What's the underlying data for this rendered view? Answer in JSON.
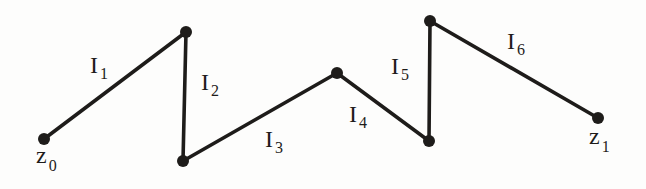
{
  "page": {
    "background": "#fdfdfc"
  },
  "diagram": {
    "ink_color": "#1e1c1a",
    "stroke_width": 3.6,
    "dot_radius": 6,
    "label_font_size": 24,
    "subscript_font_size": 16,
    "subscript_dy": 6,
    "endpoint_subscript_dy": 8,
    "vertices": [
      {
        "id": "z0",
        "x": 44,
        "y": 139
      },
      {
        "id": "v1",
        "x": 186,
        "y": 32
      },
      {
        "id": "v2",
        "x": 183,
        "y": 161
      },
      {
        "id": "v3",
        "x": 337,
        "y": 73
      },
      {
        "id": "v4",
        "x": 429,
        "y": 141
      },
      {
        "id": "v5",
        "x": 430,
        "y": 21
      },
      {
        "id": "z1",
        "x": 598,
        "y": 118
      }
    ],
    "segments": [
      {
        "id": "I1",
        "from": "z0",
        "to": "v1",
        "label": {
          "base": "I",
          "sub": "1",
          "x": 90,
          "y": 73
        }
      },
      {
        "id": "I2",
        "from": "v1",
        "to": "v2",
        "label": {
          "base": "I",
          "sub": "2",
          "x": 201,
          "y": 90
        }
      },
      {
        "id": "I3",
        "from": "v2",
        "to": "v3",
        "label": {
          "base": "I",
          "sub": "3",
          "x": 265,
          "y": 147
        }
      },
      {
        "id": "I4",
        "from": "v3",
        "to": "v4",
        "label": {
          "base": "I",
          "sub": "4",
          "x": 349,
          "y": 122
        }
      },
      {
        "id": "I5",
        "from": "v4",
        "to": "v5",
        "label": {
          "base": "I",
          "sub": "5",
          "x": 391,
          "y": 74
        }
      },
      {
        "id": "I6",
        "from": "v5",
        "to": "z1",
        "label": {
          "base": "I",
          "sub": "6",
          "x": 507,
          "y": 49
        }
      }
    ],
    "endpoint_labels": [
      {
        "for": "z0",
        "base": "z",
        "sub": "0",
        "x": 36,
        "y": 163
      },
      {
        "for": "z1",
        "base": "z",
        "sub": "1",
        "x": 589,
        "y": 144
      }
    ]
  }
}
